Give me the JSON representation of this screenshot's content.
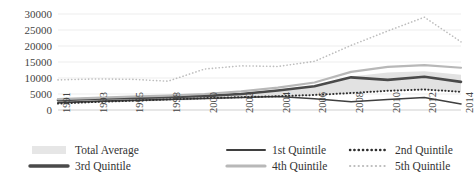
{
  "chart_data": {
    "type": "line",
    "title": "",
    "xlabel": "",
    "ylabel": "",
    "grid": true,
    "legend_position": "bottom",
    "ylim": [
      0,
      30000
    ],
    "yticks": [
      0,
      5000,
      10000,
      15000,
      20000,
      25000,
      30000
    ],
    "ytick_labels": [
      "0",
      "5000",
      "10000",
      "15000",
      "20000",
      "25000",
      "30000"
    ],
    "categories": [
      "1991",
      "1993",
      "1995",
      "1998",
      "2000",
      "2002",
      "2004",
      "2006",
      "2008",
      "2010",
      "2012",
      "2014"
    ],
    "series": [
      {
        "name": "Total Average",
        "style": "band",
        "color": "#e2e2e2",
        "values": [
          3000,
          3500,
          4000,
          4200,
          4600,
          5200,
          6300,
          7600,
          10500,
          11700,
          12100,
          11000
        ],
        "band_lower": [
          1900,
          2300,
          2600,
          2900,
          3200,
          3600,
          4000,
          4500,
          5200,
          6000,
          6300,
          5600
        ]
      },
      {
        "name": "1st Quintile",
        "style": "solid",
        "color": "#3f3f3f",
        "values": [
          2300,
          2700,
          3000,
          3300,
          3600,
          3900,
          4200,
          3500,
          2600,
          3300,
          3900,
          1900
        ]
      },
      {
        "name": "2nd Quintile",
        "style": "dotted",
        "color": "#2e2e2e",
        "values": [
          2000,
          2500,
          2900,
          3300,
          3700,
          4000,
          4300,
          4700,
          5300,
          6000,
          6400,
          5700
        ]
      },
      {
        "name": "3rd Quintile",
        "style": "thick-solid",
        "color": "#4a4a4a",
        "values": [
          3100,
          3500,
          3800,
          4000,
          4400,
          5000,
          6100,
          7400,
          10200,
          9400,
          10400,
          8800
        ]
      },
      {
        "name": "4th Quintile",
        "style": "light-solid",
        "color": "#b8b8b8",
        "values": [
          3400,
          3800,
          4200,
          4500,
          5000,
          5800,
          7000,
          8600,
          11900,
          13500,
          14000,
          13200
        ]
      },
      {
        "name": "5th Quintile",
        "style": "light-dotted",
        "color": "#bdbdbd",
        "values": [
          9400,
          9700,
          9600,
          9000,
          12800,
          13800,
          13600,
          15200,
          20200,
          24700,
          29000,
          21300
        ]
      }
    ]
  },
  "legend": {
    "items": [
      {
        "label": "Total Average",
        "key": "band-swatch"
      },
      {
        "label": "1st Quintile",
        "key": "solid-dark-line"
      },
      {
        "label": "2nd Quintile",
        "key": "dotted-dark-line"
      },
      {
        "label": "3rd Quintile",
        "key": "thick-dark-line"
      },
      {
        "label": "4th Quintile",
        "key": "solid-light-line"
      },
      {
        "label": "5th Quintile",
        "key": "dotted-light-line"
      }
    ]
  }
}
